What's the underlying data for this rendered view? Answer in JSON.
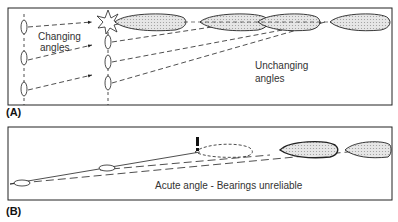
{
  "panels": [
    {
      "id": "A",
      "label": "(A)",
      "annotations": [
        "Changing",
        "angles",
        "Unchanging",
        "angles"
      ]
    },
    {
      "id": "B",
      "label": "(B)",
      "annotations": [
        "Acute angle - Bearings unreliable"
      ]
    }
  ],
  "colors": {
    "line": "#222222",
    "hull_fill": "#d9d9d9",
    "background": "#ffffff"
  }
}
